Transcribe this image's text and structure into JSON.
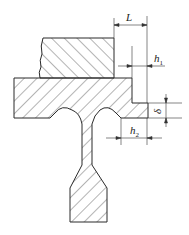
{
  "diagram": {
    "type": "forging die flash land cross-section",
    "colors": {
      "stroke": "#2a2a2a",
      "hatch": "#444444",
      "background": "#ffffff"
    },
    "dimensions": [
      {
        "id": "L",
        "symbol": "L",
        "subscript": ""
      },
      {
        "id": "h1",
        "symbol": "h",
        "subscript": "1"
      },
      {
        "id": "delta",
        "symbol": "δ",
        "subscript": ""
      },
      {
        "id": "h2",
        "symbol": "h",
        "subscript": "2"
      }
    ]
  }
}
